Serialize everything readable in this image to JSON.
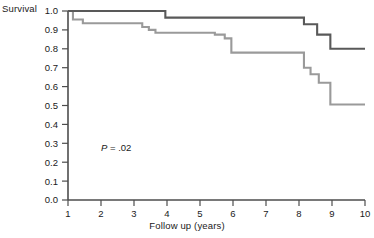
{
  "chart_data": {
    "type": "line",
    "title": "",
    "xlabel": "Follow up (years)",
    "ylabel": "Survival",
    "xlim": [
      1,
      10
    ],
    "ylim": [
      0.0,
      1.0
    ],
    "grid": false,
    "legend": null,
    "annotations": [
      {
        "text": "P = .02",
        "x": 2.0,
        "y": 0.25
      }
    ],
    "xticks": [
      "1",
      "2",
      "3",
      "4",
      "5",
      "6",
      "7",
      "8",
      "9",
      "10"
    ],
    "yticks": [
      "0.0",
      "0.1",
      "0.2",
      "0.3",
      "0.4",
      "0.5",
      "0.6",
      "0.7",
      "0.8",
      "0.9",
      "1.0"
    ],
    "series": [
      {
        "name": "upper-curve",
        "style": "step",
        "color": "#595959",
        "x": [
          1.0,
          3.95,
          3.95,
          8.15,
          8.15,
          8.55,
          8.55,
          8.95,
          8.95,
          10.0
        ],
        "values": [
          1.0,
          1.0,
          0.965,
          0.965,
          0.93,
          0.93,
          0.875,
          0.875,
          0.8,
          0.8
        ]
      },
      {
        "name": "lower-curve",
        "style": "step",
        "color": "#9a9a9a",
        "x": [
          1.0,
          1.15,
          1.15,
          1.45,
          1.45,
          3.25,
          3.25,
          3.45,
          3.45,
          3.65,
          3.65,
          5.45,
          5.45,
          5.75,
          5.75,
          5.95,
          5.95,
          8.15,
          8.15,
          8.35,
          8.35,
          8.6,
          8.6,
          8.95,
          8.95,
          10.0
        ],
        "values": [
          1.0,
          1.0,
          0.955,
          0.955,
          0.935,
          0.935,
          0.915,
          0.915,
          0.9,
          0.9,
          0.885,
          0.885,
          0.875,
          0.875,
          0.855,
          0.855,
          0.78,
          0.78,
          0.7,
          0.7,
          0.665,
          0.665,
          0.62,
          0.62,
          0.505,
          0.505
        ]
      }
    ]
  },
  "colors": {
    "axis": "#4d4d4d",
    "text": "#1a1a1a",
    "upper_series": "#595959",
    "lower_series": "#9a9a9a",
    "background": "#ffffff"
  }
}
